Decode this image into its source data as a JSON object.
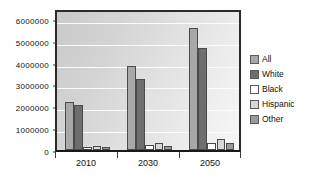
{
  "chart_data": {
    "type": "bar",
    "title": "",
    "subtitle": "",
    "xlabel": "",
    "ylabel": "",
    "categories": [
      "2010",
      "2030",
      "2050"
    ],
    "series": [
      {
        "name": "All",
        "values": [
          2200000,
          3850000,
          5600000
        ],
        "color": "#a8a8a8"
      },
      {
        "name": "White",
        "values": [
          2050000,
          3250000,
          4650000
        ],
        "color": "#6e6e6e"
      },
      {
        "name": "Black",
        "values": [
          150000,
          230000,
          330000
        ],
        "color": "#ffffff"
      },
      {
        "name": "Hispanic",
        "values": [
          170000,
          340000,
          490000
        ],
        "color": "#d8d8d8"
      },
      {
        "name": "Other",
        "values": [
          130000,
          180000,
          300000
        ],
        "color": "#9a9a9a"
      }
    ],
    "ylim": [
      0,
      6500000
    ],
    "y_ticks": [
      0,
      1000000,
      2000000,
      3000000,
      4000000,
      5000000,
      6000000
    ],
    "y_tick_labels": [
      "0",
      "1000000",
      "2000000",
      "3000000",
      "4000000",
      "5000000",
      "6000000"
    ],
    "grid": true,
    "grid_axis": "y",
    "legend_position": "right",
    "legend_entries": [
      "All",
      "White",
      "Black",
      "Hispanic",
      "Other"
    ],
    "plot_background": "#dedede",
    "axis_color": "#2b2b2b"
  }
}
